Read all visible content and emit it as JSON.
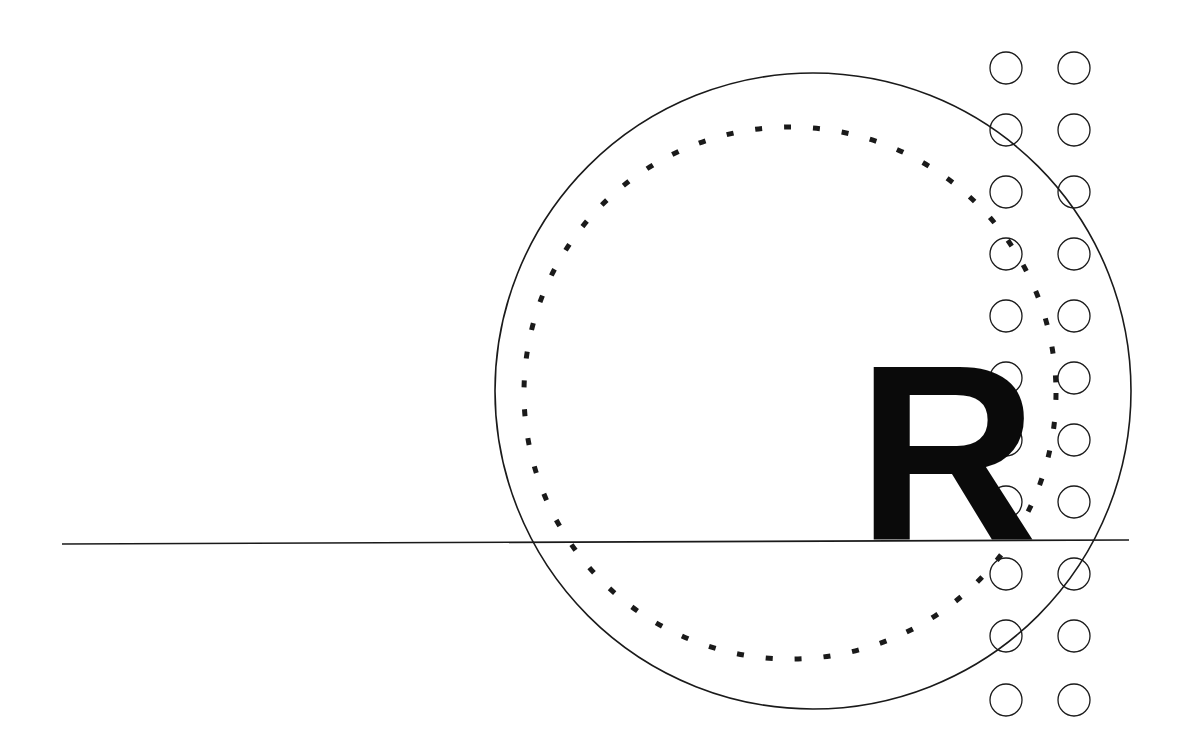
{
  "canvas": {
    "width": 1184,
    "height": 746,
    "background": "#ffffff"
  },
  "figure": {
    "stroke_color": "#1a1a1a",
    "glyph_color": "#0a0a0a",
    "elements": {
      "outer_circle": {
        "name": "outer-solid-circle",
        "cx": 813,
        "cy": 391,
        "r": 318,
        "stroke_width": 1.6,
        "style": "solid"
      },
      "inner_circle": {
        "name": "inner-dashed-circle",
        "cx": 790,
        "cy": 393,
        "r": 266,
        "stroke_width": 5,
        "style": "dashed",
        "dash_array": "7 22"
      },
      "baseline": {
        "name": "horizontal-baseline",
        "x1": 62,
        "y1": 544,
        "x2": 1129,
        "y2": 540,
        "stroke_width": 1.6
      },
      "glyph": {
        "character": "R",
        "x": 857,
        "baseline_y": 540,
        "font_size": 250
      },
      "dot_grid": {
        "name": "circle-dot-grid",
        "radius": 16,
        "stroke_width": 1.3,
        "columns_x": [
          1006,
          1074
        ],
        "rows_y": [
          68,
          130,
          192,
          254,
          316,
          378,
          440,
          502,
          574,
          636,
          700
        ]
      }
    }
  }
}
